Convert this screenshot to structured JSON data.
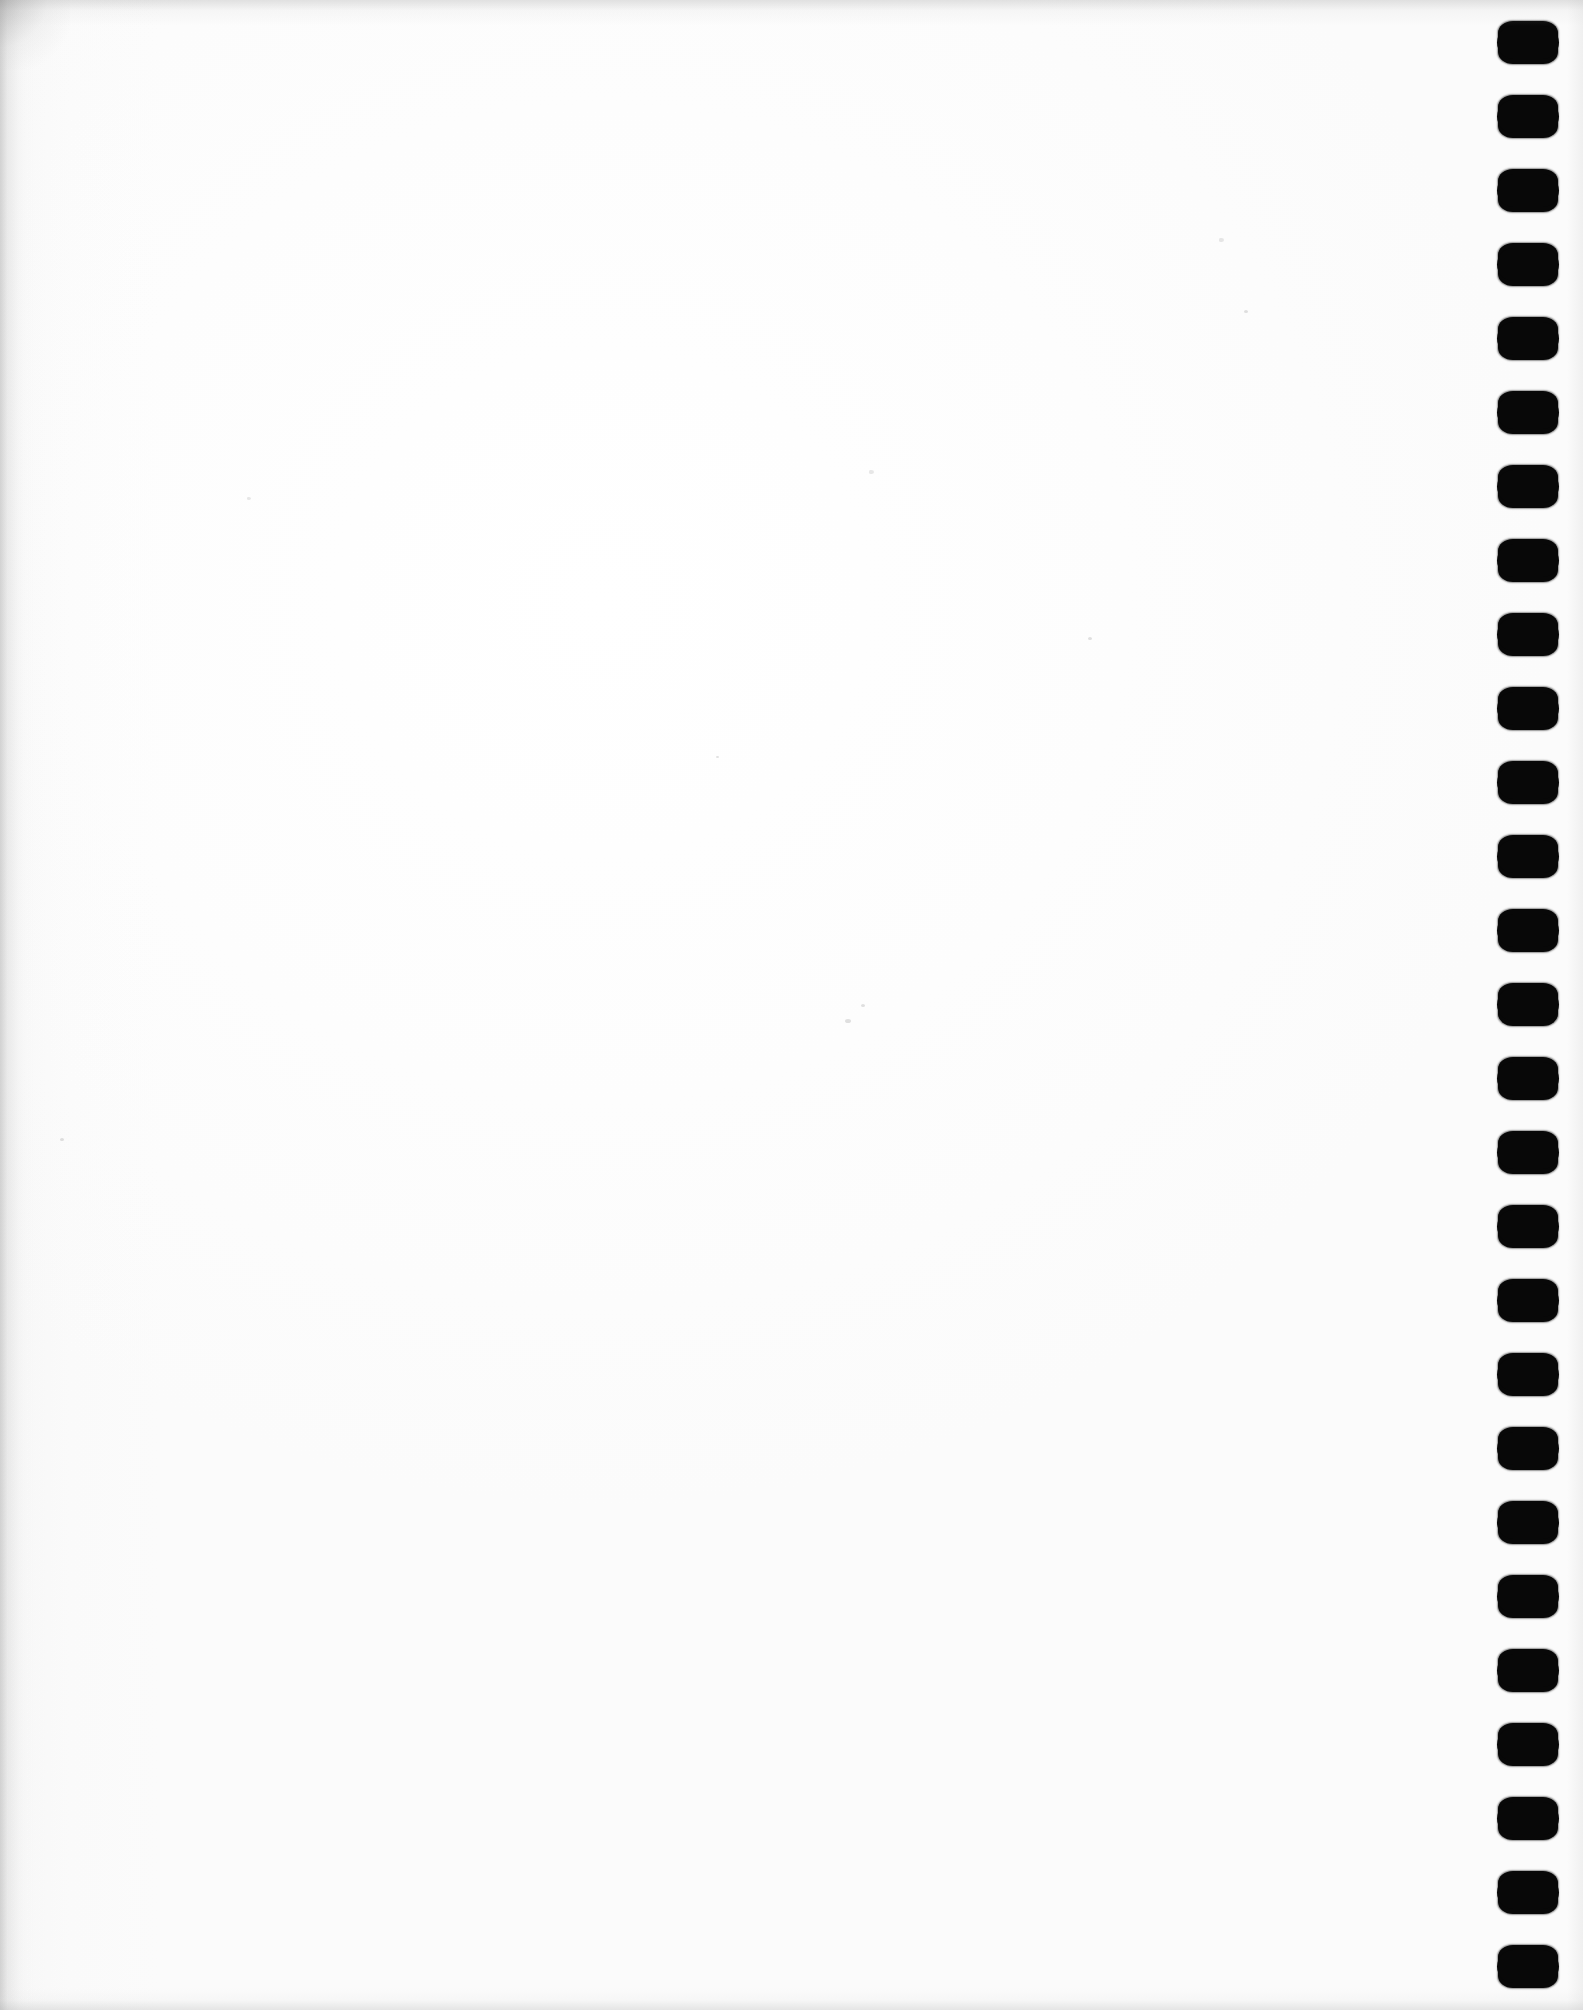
{
  "document": {
    "kind": "scanned-page",
    "title": "Scanned blank notebook page",
    "content_text": "",
    "page_width": 1583,
    "page_height": 2010,
    "background_color": "#ffffff",
    "paper_tone": "#fdfdfd",
    "text_regions": []
  },
  "binding": {
    "name": "comb-punch-hole-column",
    "edge": "right",
    "hole_shape": "rounded-rectangle-slot",
    "hole_color": "#080808",
    "hole_count": 27,
    "hole_width": 60,
    "hole_height": 43,
    "column_left": 1496,
    "first_hole_top": 21,
    "pitch": 74,
    "holes": [
      {
        "index": 1,
        "top": 21
      },
      {
        "index": 2,
        "top": 95
      },
      {
        "index": 3,
        "top": 169
      },
      {
        "index": 4,
        "top": 243
      },
      {
        "index": 5,
        "top": 317
      },
      {
        "index": 6,
        "top": 391
      },
      {
        "index": 7,
        "top": 465
      },
      {
        "index": 8,
        "top": 539
      },
      {
        "index": 9,
        "top": 613
      },
      {
        "index": 10,
        "top": 687
      },
      {
        "index": 11,
        "top": 761
      },
      {
        "index": 12,
        "top": 835
      },
      {
        "index": 13,
        "top": 909
      },
      {
        "index": 14,
        "top": 983
      },
      {
        "index": 15,
        "top": 1057
      },
      {
        "index": 16,
        "top": 1131
      },
      {
        "index": 17,
        "top": 1205
      },
      {
        "index": 18,
        "top": 1279
      },
      {
        "index": 19,
        "top": 1353
      },
      {
        "index": 20,
        "top": 1427
      },
      {
        "index": 21,
        "top": 1501
      },
      {
        "index": 22,
        "top": 1575
      },
      {
        "index": 23,
        "top": 1649
      },
      {
        "index": 24,
        "top": 1723
      },
      {
        "index": 25,
        "top": 1797
      },
      {
        "index": 26,
        "top": 1871
      },
      {
        "index": 27,
        "top": 1945
      }
    ]
  },
  "scan_artifacts": {
    "edge_shadows": [
      "left",
      "top",
      "bottom",
      "right"
    ],
    "corner_smudge": "top-left",
    "specks": [
      {
        "left": 869,
        "top": 470,
        "size": 5
      },
      {
        "left": 845,
        "top": 1019,
        "size": 6
      },
      {
        "left": 861,
        "top": 1004,
        "size": 4
      },
      {
        "left": 247,
        "top": 497,
        "size": 4
      },
      {
        "left": 1088,
        "top": 637,
        "size": 4
      },
      {
        "left": 60,
        "top": 1138,
        "size": 4
      },
      {
        "left": 1219,
        "top": 238,
        "size": 5
      },
      {
        "left": 1244,
        "top": 310,
        "size": 4
      },
      {
        "left": 716,
        "top": 756,
        "size": 3
      }
    ]
  }
}
